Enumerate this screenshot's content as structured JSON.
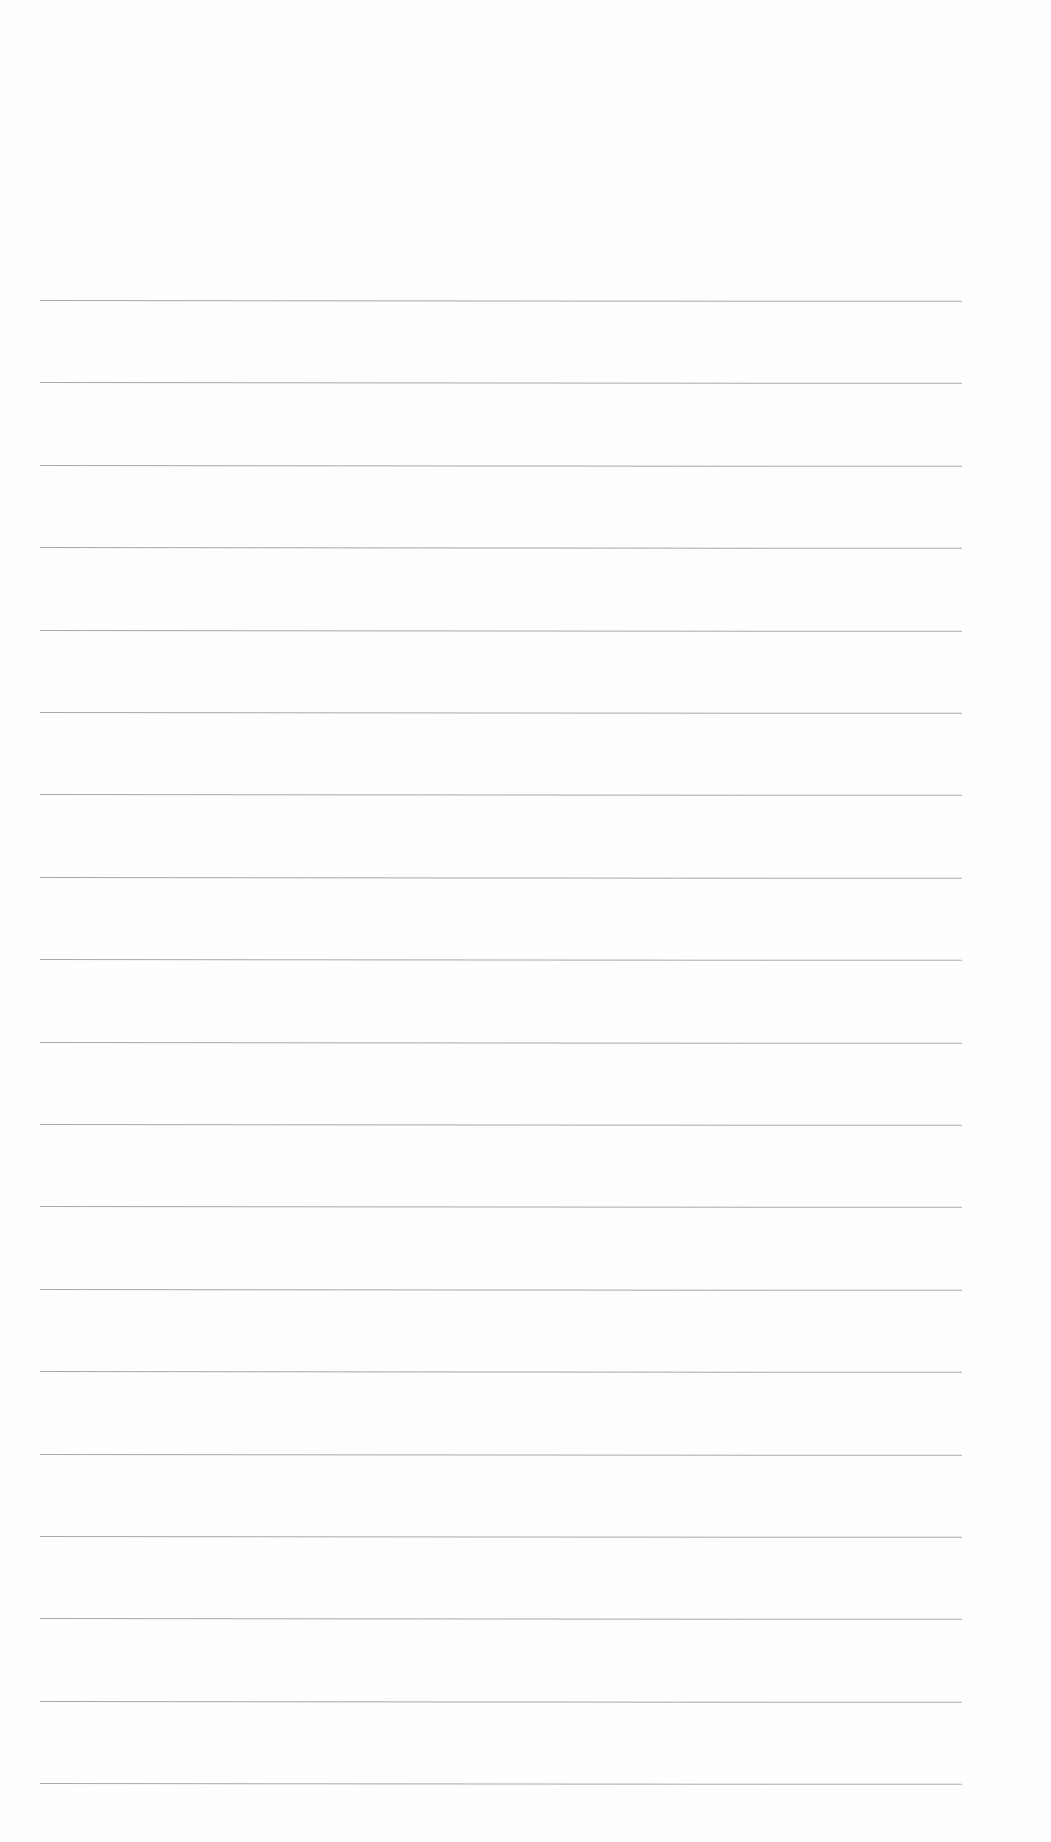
{
  "document": {
    "type": "blank ruled sheet",
    "background": "#fefefe",
    "rule_color": "#9a9a9a",
    "rule_count": 19,
    "first_rule_y": 300,
    "rule_spacing": 82.4,
    "rule_left_x": 40,
    "rule_right_x": 962
  }
}
